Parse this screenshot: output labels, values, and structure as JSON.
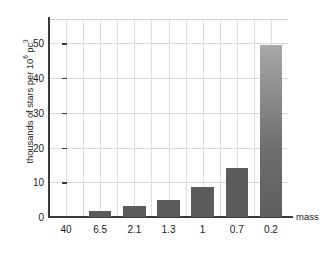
{
  "chart_data": {
    "type": "bar",
    "title": "",
    "subtitle": "",
    "xlabel": "mass",
    "ylabel": "thousands of stars per 10⁶ pc³",
    "ylabel_prefix": "thousands of stars per 10",
    "ylabel_exp1": "6",
    "ylabel_mid": " pc",
    "ylabel_exp2": "3",
    "categories": [
      "40",
      "6.5",
      "2.1",
      "1.3",
      "1",
      "0.7",
      "0.2"
    ],
    "values": [
      0,
      1.8,
      3.2,
      4.8,
      8.6,
      14.0,
      49.5
    ],
    "ylim": [
      0,
      57
    ],
    "yticks": [
      0,
      10,
      20,
      30,
      40,
      50
    ],
    "ytick_labels": [
      "0",
      "10",
      "20",
      "30",
      "40",
      "50"
    ],
    "grid": true,
    "grid_horizontal": true,
    "grid_vertical": true,
    "legend": false,
    "legend_position": "none",
    "bar_color": "#5b5b5b",
    "bar_color_tall_top": "#a8a8a8",
    "axis_color": "#3a3a3a",
    "grid_color": "#d9d9dd",
    "background": "#ffffff",
    "annotations": []
  }
}
